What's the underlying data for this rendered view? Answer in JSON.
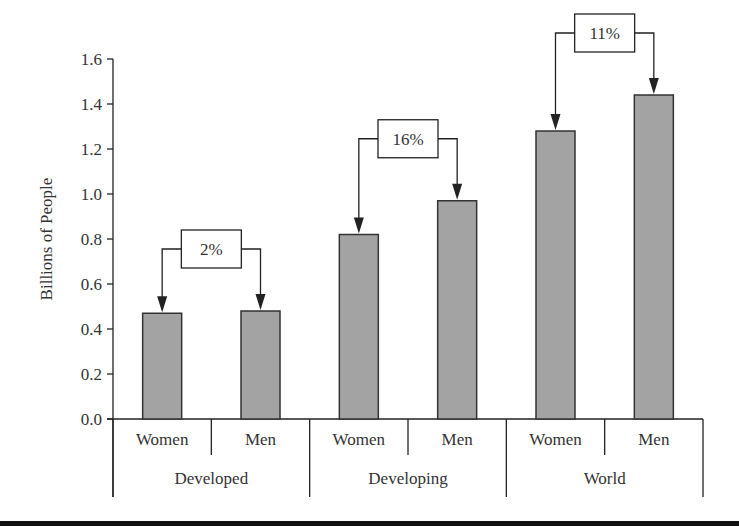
{
  "chart_data": {
    "type": "bar",
    "title": "",
    "xlabel": "",
    "ylabel": "Billions of People",
    "ylim": [
      0.0,
      1.6
    ],
    "yticks": [
      "0.0",
      "0.2",
      "0.4",
      "0.6",
      "0.8",
      "1.0",
      "1.2",
      "1.4",
      "1.6"
    ],
    "grid": false,
    "legend": null,
    "groups": [
      {
        "name": "Developed",
        "categories": [
          "Women",
          "Men"
        ],
        "values": [
          0.47,
          0.48
        ],
        "difference_label": "2%"
      },
      {
        "name": "Developing",
        "categories": [
          "Women",
          "Men"
        ],
        "values": [
          0.82,
          0.97
        ],
        "difference_label": "16%"
      },
      {
        "name": "World",
        "categories": [
          "Women",
          "Men"
        ],
        "values": [
          1.28,
          1.44
        ],
        "difference_label": "11%"
      }
    ],
    "colors": {
      "bar_fill": "#a3a3a3",
      "bar_stroke": "#333333",
      "axis": "#222222",
      "text": "#333333"
    }
  }
}
